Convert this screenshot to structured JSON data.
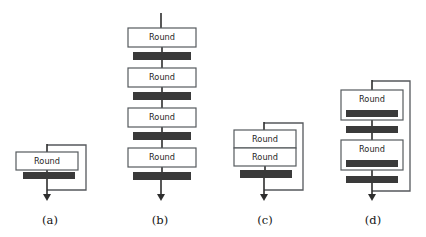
{
  "figure": {
    "background_color": "#ffffff",
    "box_label": "Round",
    "box_fill": "#ffffff",
    "box_stroke": "#555a5e",
    "bar_color": "#3a3a3a",
    "wire_color": "#55585c",
    "arrow_color": "#2e2e2e",
    "panels": [
      {
        "id": "a",
        "caption": "(a)",
        "caption_x": 50,
        "caption_y": 224,
        "rounds": 1,
        "bars_outside": 1,
        "bars_inside_box": 0,
        "skip_connection": true,
        "boxes": [
          {
            "x": 16,
            "y": 152,
            "w": 62,
            "h": 18,
            "label": "Round"
          }
        ],
        "bars": [
          {
            "x": 23,
            "y": 172,
            "w": 52,
            "h": 7
          }
        ],
        "input_line": {
          "x": 47,
          "y1": 144,
          "y2": 152
        },
        "output_arrow": {
          "x": 47,
          "y1": 179,
          "y2": 201
        },
        "skip_path": "M47,145 L86,145 L86,190 L47,190"
      },
      {
        "id": "b",
        "caption": "(b)",
        "caption_x": 160,
        "caption_y": 224,
        "rounds": 4,
        "bars_outside": 4,
        "bars_inside_box": 0,
        "skip_connection": false,
        "boxes": [
          {
            "x": 128,
            "y": 28,
            "w": 68,
            "h": 19,
            "label": "Round"
          },
          {
            "x": 128,
            "y": 68,
            "w": 68,
            "h": 19,
            "label": "Round"
          },
          {
            "x": 128,
            "y": 108,
            "w": 68,
            "h": 19,
            "label": "Round"
          },
          {
            "x": 128,
            "y": 148,
            "w": 68,
            "h": 19,
            "label": "Round"
          }
        ],
        "bars": [
          {
            "x": 133,
            "y": 52,
            "w": 58,
            "h": 8
          },
          {
            "x": 133,
            "y": 92,
            "w": 58,
            "h": 8
          },
          {
            "x": 133,
            "y": 132,
            "w": 58,
            "h": 8
          },
          {
            "x": 133,
            "y": 172,
            "w": 58,
            "h": 8
          }
        ],
        "input_line": {
          "x": 161,
          "y1": 13,
          "y2": 28
        },
        "output_arrow": {
          "x": 161,
          "y1": 180,
          "y2": 201
        }
      },
      {
        "id": "c",
        "caption": "(c)",
        "caption_x": 265,
        "caption_y": 224,
        "rounds": 2,
        "bars_outside": 1,
        "bars_inside_box": 0,
        "skip_connection": true,
        "boxes": [
          {
            "x": 234,
            "y": 130,
            "w": 62,
            "h": 18,
            "label": "Round"
          },
          {
            "x": 234,
            "y": 148,
            "w": 62,
            "h": 18,
            "label": "Round"
          }
        ],
        "bars": [
          {
            "x": 240,
            "y": 170,
            "w": 52,
            "h": 8
          }
        ],
        "input_line": {
          "x": 264,
          "y1": 122,
          "y2": 130
        },
        "output_arrow": {
          "x": 264,
          "y1": 178,
          "y2": 201
        },
        "skip_path": "M264,123 L303,123 L303,190 L264,190"
      },
      {
        "id": "d",
        "caption": "(d)",
        "caption_x": 373,
        "caption_y": 224,
        "rounds": 2,
        "bars_outside": 2,
        "bars_inside_box": 2,
        "skip_connection": true,
        "boxes": [
          {
            "x": 341,
            "y": 90,
            "w": 62,
            "h": 30,
            "label": "Round"
          },
          {
            "x": 341,
            "y": 140,
            "w": 62,
            "h": 30,
            "label": "Round"
          }
        ],
        "bars_in_box": [
          {
            "x": 346,
            "y": 110,
            "w": 52,
            "h": 7
          },
          {
            "x": 346,
            "y": 160,
            "w": 52,
            "h": 7
          }
        ],
        "bars": [
          {
            "x": 346,
            "y": 126,
            "w": 52,
            "h": 7
          },
          {
            "x": 346,
            "y": 176,
            "w": 52,
            "h": 7
          }
        ],
        "input_line": {
          "x": 372,
          "y1": 80,
          "y2": 90
        },
        "output_arrow": {
          "x": 372,
          "y1": 183,
          "y2": 201
        },
        "skip_path": "M372,81 L410,81 L410,191 L372,191"
      }
    ]
  }
}
